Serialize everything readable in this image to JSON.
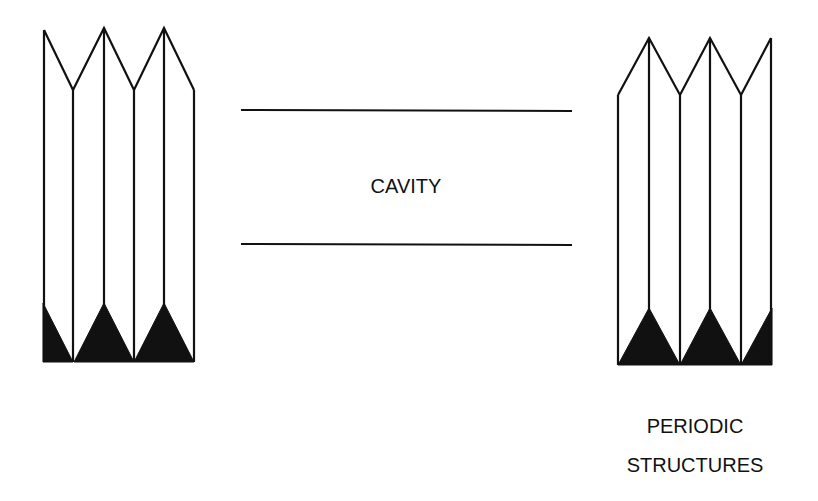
{
  "diagram": {
    "cavity_label": "CAVITY",
    "periodic_label_line1": "PERIODIC",
    "periodic_label_line2": "STRUCTURES",
    "stroke_color": "#111111",
    "background": "#ffffff",
    "elements": [
      {
        "name": "left-periodic-structure",
        "type": "folded-grating",
        "vertical_lines": 6
      },
      {
        "name": "cavity-top-wall",
        "type": "line"
      },
      {
        "name": "cavity-bottom-wall",
        "type": "line"
      },
      {
        "name": "right-periodic-structure",
        "type": "folded-grating",
        "vertical_lines": 6
      }
    ]
  }
}
